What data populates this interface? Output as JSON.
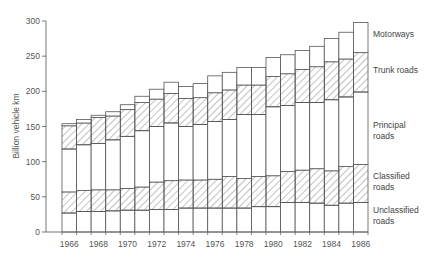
{
  "chart_data": {
    "type": "bar",
    "stacked": true,
    "title": "",
    "xlabel": "",
    "ylabel": "Billion vehicle km",
    "ylim": [
      0,
      300
    ],
    "yticks": [
      0,
      50,
      100,
      150,
      200,
      250,
      300
    ],
    "grid": false,
    "legend_position": "right (inline labels beside last bar)",
    "categories": [
      "1966",
      "1967",
      "1968",
      "1969",
      "1970",
      "1971",
      "1972",
      "1973",
      "1974",
      "1975",
      "1976",
      "1977",
      "1978",
      "1979",
      "1980",
      "1981",
      "1982",
      "1983",
      "1984",
      "1985",
      "1986"
    ],
    "xtick_labels": [
      "1966",
      "1968",
      "1970",
      "1972",
      "1974",
      "1976",
      "1978",
      "1980",
      "1982",
      "1984",
      "1986"
    ],
    "series": [
      {
        "name": "Unclassified roads",
        "label_lines": [
          "Unclassified",
          "roads"
        ],
        "hatched": false,
        "values": [
          27,
          29,
          29,
          30,
          31,
          31,
          32,
          32,
          34,
          34,
          34,
          34,
          34,
          36,
          36,
          42,
          42,
          41,
          38,
          41,
          42
        ]
      },
      {
        "name": "Classified roads",
        "label_lines": [
          "Classified",
          "roads"
        ],
        "hatched": true,
        "values": [
          30,
          30,
          31,
          30,
          31,
          33,
          39,
          41,
          40,
          40,
          41,
          45,
          42,
          43,
          44,
          44,
          46,
          49,
          49,
          52,
          54
        ]
      },
      {
        "name": "Principal roads",
        "label_lines": [
          "Principal",
          "roads"
        ],
        "hatched": false,
        "values": [
          61,
          65,
          66,
          71,
          74,
          80,
          79,
          82,
          76,
          79,
          82,
          81,
          91,
          88,
          98,
          94,
          96,
          94,
          101,
          99,
          103
        ]
      },
      {
        "name": "Trunk roads",
        "label_lines": [
          "Trunk roads"
        ],
        "hatched": true,
        "values": [
          33,
          31,
          37,
          34,
          38,
          40,
          39,
          42,
          40,
          38,
          41,
          42,
          42,
          42,
          43,
          45,
          47,
          51,
          54,
          54,
          56
        ]
      },
      {
        "name": "Motorways",
        "label_lines": [
          "Motorways"
        ],
        "hatched": false,
        "values": [
          3,
          5,
          3,
          6,
          7,
          9,
          14,
          16,
          17,
          20,
          24,
          25,
          25,
          25,
          27,
          27,
          27,
          29,
          33,
          38,
          43
        ]
      }
    ],
    "totals": [
      154,
      160,
      166,
      171,
      181,
      193,
      203,
      213,
      207,
      211,
      222,
      227,
      234,
      234,
      248,
      252,
      258,
      264,
      275,
      284,
      298
    ]
  },
  "colors": {
    "bar_stroke": "#555555",
    "hatch": "#666666",
    "axis": "#666666",
    "background": "#ffffff"
  }
}
